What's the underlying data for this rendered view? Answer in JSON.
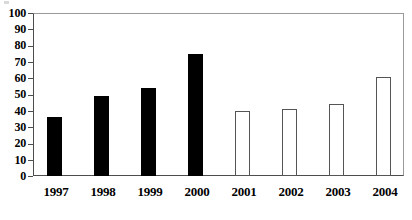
{
  "chart_data": {
    "type": "bar",
    "title": "",
    "subtitle": "",
    "xlabel": "",
    "ylabel": "",
    "categories": [
      "1997",
      "1998",
      "1999",
      "2000",
      "2001",
      "2002",
      "2003",
      "2004"
    ],
    "values": [
      36,
      49,
      54,
      75,
      40,
      41,
      44,
      61
    ],
    "series": [
      {
        "name": "",
        "values": [
          36,
          49,
          54,
          75,
          40,
          41,
          44,
          61
        ],
        "styles": [
          "solid",
          "solid",
          "solid",
          "solid",
          "open",
          "open",
          "open",
          "open"
        ]
      }
    ],
    "ylim": [
      0,
      100
    ],
    "y_ticks": [
      0,
      10,
      20,
      30,
      40,
      50,
      60,
      70,
      80,
      90,
      100
    ],
    "y_tick_labels": [
      "0",
      "10",
      "20",
      "30",
      "40",
      "50",
      "60",
      "70",
      "80",
      "90",
      "100"
    ],
    "grid": false,
    "legend": null,
    "legend_position": "none",
    "annotations": [],
    "colors": {
      "solid_bar": "#000000",
      "open_bar_fill": "#ffffff",
      "open_bar_border": "#555555",
      "axis": "#4d4d4d",
      "frame": "#9a9a9a",
      "background": "#ffffff",
      "text": "#000000"
    }
  }
}
